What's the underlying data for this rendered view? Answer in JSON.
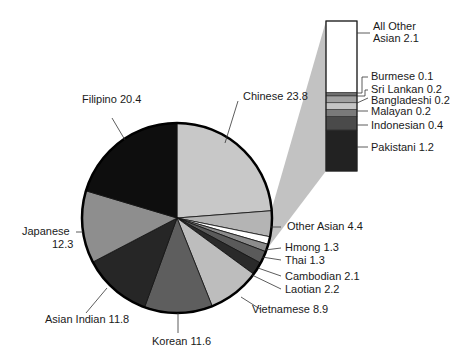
{
  "chart_data": {
    "type": "pie",
    "title": "",
    "unit": "percent",
    "slices": [
      {
        "label": "Chinese",
        "value": 23.8,
        "color": "#c8c8c8"
      },
      {
        "label": "Other Asian",
        "value": 4.4,
        "color": "#b4b4b4"
      },
      {
        "label": "Hmong",
        "value": 1.3,
        "color": "#ffffff"
      },
      {
        "label": "Thai",
        "value": 1.3,
        "color": "#8c8c8c"
      },
      {
        "label": "Cambodian",
        "value": 2.1,
        "color": "#5a5a5a"
      },
      {
        "label": "Laotian",
        "value": 2.2,
        "color": "#2a2a2a"
      },
      {
        "label": "Vietnamese",
        "value": 8.9,
        "color": "#bdbdbd"
      },
      {
        "label": "Korean",
        "value": 11.6,
        "color": "#5e5e5e"
      },
      {
        "label": "Asian Indian",
        "value": 11.8,
        "color": "#262626"
      },
      {
        "label": "Japanese",
        "value": 12.3,
        "color": "#8e8e8e"
      },
      {
        "label": "Filipino",
        "value": 20.4,
        "color": "#0e0e0e"
      }
    ],
    "breakout": {
      "source_slice": "Other Asian",
      "total": 4.4,
      "segments": [
        {
          "label": "All Other Asian",
          "value": 2.1,
          "color": "#ffffff"
        },
        {
          "label": "Burmese",
          "value": 0.1,
          "color": "#6e6e6e"
        },
        {
          "label": "Sri Lankan",
          "value": 0.2,
          "color": "#a0a0a0"
        },
        {
          "label": "Bangladeshi",
          "value": 0.2,
          "color": "#c4c4c4"
        },
        {
          "label": "Malayan",
          "value": 0.2,
          "color": "#7a7a7a"
        },
        {
          "label": "Indonesian",
          "value": 0.4,
          "color": "#4a4a4a"
        },
        {
          "label": "Pakistani",
          "value": 1.2,
          "color": "#222222"
        }
      ]
    },
    "labels": {
      "chinese": "Chinese 23.8",
      "filipino": "Filipino 20.4",
      "japanese_1": "Japanese",
      "japanese_2": "12.3",
      "asian_indian": "Asian Indian 11.8",
      "korean": "Korean 11.6",
      "vietnamese": "Vietnamese 8.9",
      "laotian": "Laotian 2.2",
      "cambodian": "Cambodian 2.1",
      "thai": "Thai 1.3",
      "hmong": "Hmong 1.3",
      "other_asian": "Other Asian 4.4",
      "all_other_1": "All Other",
      "all_other_2": "Asian 2.1",
      "burmese": "Burmese 0.1",
      "sri_lankan": "Sri Lankan 0.2",
      "bangladeshi": "Bangladeshi 0.2",
      "malayan": "Malayan 0.2",
      "indonesian": "Indonesian 0.4",
      "pakistani": "Pakistani 1.2"
    },
    "legend": null
  }
}
